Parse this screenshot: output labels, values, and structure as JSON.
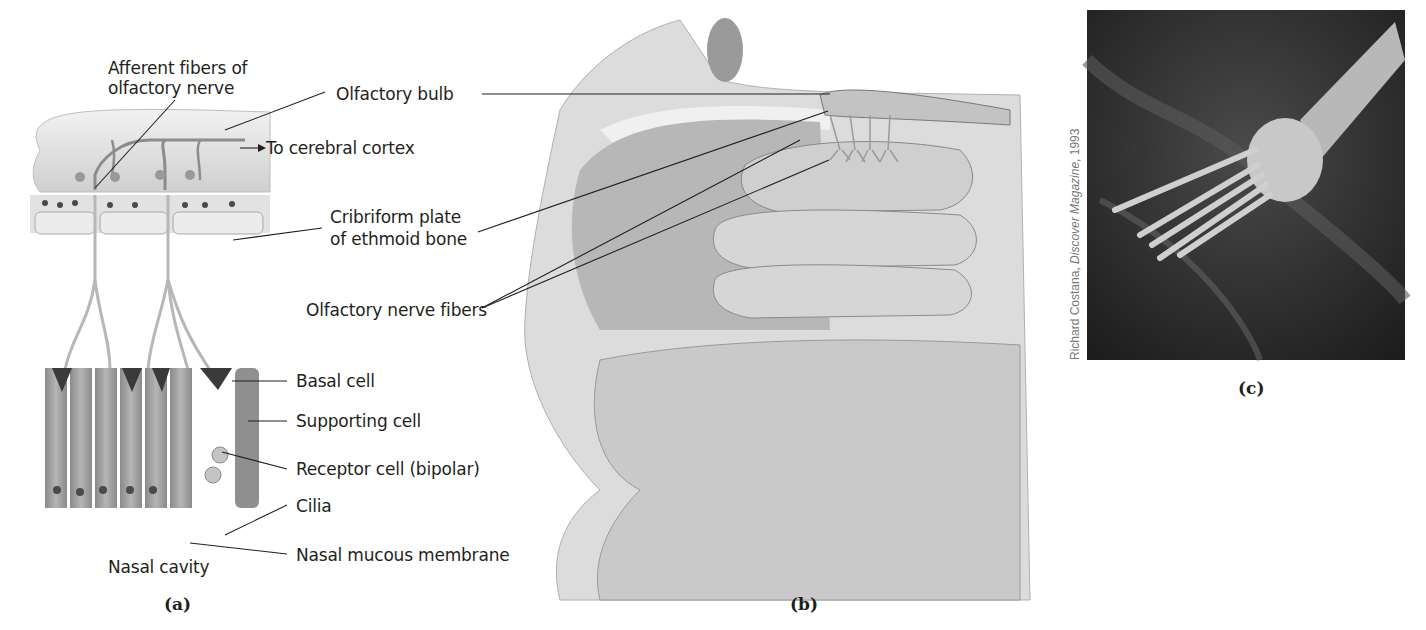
{
  "figure": {
    "panels": {
      "a": {
        "letter": "(a)",
        "labels": {
          "afferent_line1": "Afferent fibers of",
          "afferent_line2": "olfactory nerve",
          "to_cortex": "To cerebral cortex",
          "basal_cell": "Basal cell",
          "supporting_cell": "Supporting cell",
          "receptor_cell": "Receptor cell (bipolar)",
          "cilia": "Cilia",
          "nasal_mucous": "Nasal mucous membrane",
          "nasal_cavity": "Nasal cavity"
        }
      },
      "b": {
        "letter": "(b)",
        "labels": {
          "olfactory_bulb": "Olfactory bulb",
          "cribriform_line1": "Cribriform plate",
          "cribriform_line2": "of ethmoid bone",
          "nerve_fibers": "Olfactory nerve fibers"
        }
      },
      "c": {
        "letter": "(c)",
        "credit_name": "Richard Costana, ",
        "credit_pub": "Discover Magazine",
        "credit_year": ", 1993"
      }
    },
    "colors": {
      "ink": "#231f20",
      "tissue_light": "#d8d8d8",
      "tissue_mid": "#a9a9a9",
      "tissue_dark": "#5a5a5a",
      "photo_bg": "#2a2a2a"
    }
  }
}
